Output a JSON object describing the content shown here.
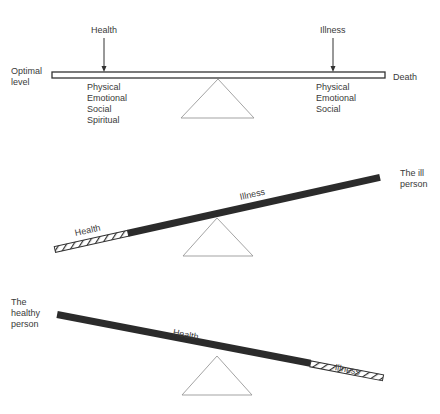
{
  "diagram": {
    "type": "seesaw-health-illness-balance",
    "panels": [
      {
        "id": "balanced",
        "beam_style": "outline",
        "top_labels": {
          "left": "Health",
          "right": "Illness"
        },
        "left_end_label": [
          "Optimal",
          "level"
        ],
        "right_end_label": "Death",
        "health_dimensions": [
          "Physical",
          "Emotional",
          "Social",
          "Spiritual"
        ],
        "illness_dimensions": [
          "Physical",
          "Emotional",
          "Social"
        ]
      },
      {
        "id": "ill-person",
        "tilt": "left side down",
        "segments": {
          "hatched": "Health",
          "solid": "Illness"
        },
        "caption": [
          "The ill",
          "person"
        ]
      },
      {
        "id": "healthy-person",
        "tilt": "right side down",
        "segments": {
          "solid": "Health",
          "hatched": "Illness"
        },
        "caption": [
          "The",
          "healthy",
          "person"
        ]
      }
    ]
  },
  "colors": {
    "ink": "#2b2b2b",
    "line": "#888888",
    "text": "#3a3a3a",
    "background": "#ffffff"
  }
}
